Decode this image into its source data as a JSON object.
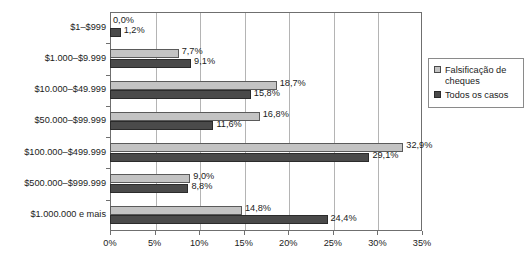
{
  "chart_data": {
    "type": "bar",
    "orientation": "horizontal",
    "title": "",
    "subtitle": "",
    "xlabel": "",
    "ylabel": "",
    "xlim": [
      0,
      35
    ],
    "xticks": [
      0,
      5,
      10,
      15,
      20,
      25,
      30,
      35
    ],
    "xtick_labels": [
      "0%",
      "5%",
      "10%",
      "15%",
      "20%",
      "25%",
      "30%",
      "35%"
    ],
    "grid": true,
    "grid_axis": "x",
    "legend_position": "right",
    "categories": [
      "$1–$999",
      "$1.000–$9.999",
      "$10.000–$49.999",
      "$50.000–$99.999",
      "$100.000–$499.999",
      "$500.000–$999.999",
      "$1.000.000 e mais"
    ],
    "series": [
      {
        "name": "Falsificação de cheques",
        "color": "#c3c3c3",
        "values": [
          0.0,
          7.7,
          18.7,
          16.8,
          32.9,
          9.0,
          14.8
        ],
        "labels": [
          "0,0%",
          "7,7%",
          "18,7%",
          "16,8%",
          "32,9%",
          "9,0%",
          "14,8%"
        ]
      },
      {
        "name": "Todos os casos",
        "color": "#4a4a4a",
        "values": [
          1.2,
          9.1,
          15.8,
          11.6,
          29.1,
          8.8,
          24.4
        ],
        "labels": [
          "1,2%",
          "9,1%",
          "15,8%",
          "11,6%",
          "29,1%",
          "8,8%",
          "24,4%"
        ]
      }
    ]
  },
  "legend": {
    "items": [
      {
        "label": "Falsificação de cheques",
        "swatch": "light-gray-swatch-icon"
      },
      {
        "label": "Todos os casos",
        "swatch": "dark-gray-swatch-icon"
      }
    ]
  }
}
